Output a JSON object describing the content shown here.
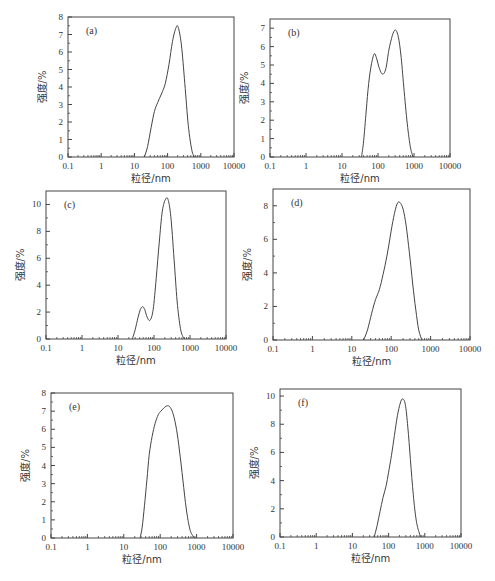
{
  "figure": {
    "xlabel": "粒径/nm",
    "ylabel": "强度/%",
    "x_ticks": [
      "0.1",
      "1",
      "10",
      "100",
      "1000",
      "10000"
    ]
  },
  "chart_data": [
    {
      "type": "line",
      "panel_label": "(a)",
      "xscale": "log",
      "xlim": [
        0.1,
        10000
      ],
      "ylim": [
        0,
        8
      ],
      "xlabel": "粒径/nm",
      "ylabel": "强度/%",
      "x_ticks": [
        0.1,
        1,
        10,
        100,
        1000,
        10000
      ],
      "y_ticks": [
        0,
        1,
        2,
        3,
        4,
        5,
        6,
        7,
        8
      ],
      "series": [
        {
          "name": "a",
          "x": [
            20,
            25,
            32,
            40,
            50,
            65,
            85,
            110,
            140,
            180,
            210,
            260,
            330,
            420,
            550,
            700
          ],
          "y": [
            0,
            0.6,
            1.7,
            2.6,
            3.1,
            3.6,
            4.2,
            5.3,
            6.6,
            7.4,
            7.4,
            6.4,
            4.2,
            1.8,
            0.3,
            0
          ]
        }
      ],
      "frame": {
        "x": 68,
        "y": 17,
        "w": 166,
        "h": 140
      }
    },
    {
      "type": "line",
      "panel_label": "(b)",
      "xscale": "log",
      "xlim": [
        0.1,
        10000
      ],
      "ylim": [
        0,
        7.5
      ],
      "xlabel": "粒径/nm",
      "ylabel": "强度/%",
      "x_ticks": [
        0.1,
        1,
        10,
        100,
        1000,
        10000
      ],
      "y_ticks": [
        0,
        1,
        2,
        3,
        4,
        5,
        6,
        7
      ],
      "series": [
        {
          "name": "b",
          "x": [
            35,
            40,
            47,
            55,
            65,
            78,
            90,
            110,
            135,
            165,
            200,
            250,
            300,
            360,
            430,
            520,
            650,
            800,
            950
          ],
          "y": [
            0,
            0.9,
            2.5,
            4.0,
            5.0,
            5.6,
            5.4,
            4.8,
            4.5,
            4.8,
            5.8,
            6.6,
            6.9,
            6.6,
            5.6,
            3.8,
            1.8,
            0.5,
            0
          ]
        }
      ],
      "frame": {
        "x": 270,
        "y": 19,
        "w": 180,
        "h": 138
      }
    },
    {
      "type": "line",
      "panel_label": "(c)",
      "xscale": "log",
      "xlim": [
        0.1,
        10000
      ],
      "ylim": [
        0,
        11
      ],
      "xlabel": "粒径/nm",
      "ylabel": "强度/%",
      "x_ticks": [
        0.1,
        1,
        10,
        100,
        1000,
        10000
      ],
      "y_ticks": [
        0,
        2,
        4,
        6,
        8,
        10
      ],
      "series": [
        {
          "name": "c",
          "x": [
            25,
            30,
            36,
            42,
            48,
            55,
            65,
            78,
            95,
            115,
            140,
            170,
            210,
            250,
            300,
            370,
            450,
            560,
            700
          ],
          "y": [
            0,
            0.7,
            1.6,
            2.2,
            2.4,
            2.2,
            1.6,
            1.4,
            2.2,
            4.5,
            7.2,
            9.5,
            10.4,
            10.3,
            8.8,
            5.5,
            2.5,
            0.6,
            0
          ]
        }
      ],
      "frame": {
        "x": 46,
        "y": 191,
        "w": 180,
        "h": 148
      }
    },
    {
      "type": "line",
      "panel_label": "(d)",
      "xscale": "log",
      "xlim": [
        0.1,
        10000
      ],
      "ylim": [
        0,
        9
      ],
      "xlabel": "粒径/nm",
      "ylabel": "强度/%",
      "x_ticks": [
        0.1,
        1,
        10,
        100,
        1000,
        10000
      ],
      "y_ticks": [
        0,
        2,
        4,
        6,
        8
      ],
      "series": [
        {
          "name": "d",
          "x": [
            20,
            25,
            32,
            40,
            50,
            62,
            78,
            95,
            115,
            140,
            165,
            200,
            240,
            290,
            350,
            420,
            500,
            600
          ],
          "y": [
            0,
            0.6,
            1.6,
            2.4,
            3.0,
            3.9,
            5.0,
            6.2,
            7.3,
            8.1,
            8.2,
            7.8,
            6.8,
            5.2,
            3.4,
            1.8,
            0.6,
            0
          ]
        }
      ],
      "frame": {
        "x": 273,
        "y": 189,
        "w": 197,
        "h": 151
      }
    },
    {
      "type": "line",
      "panel_label": "(e)",
      "xscale": "log",
      "xlim": [
        0.1,
        10000
      ],
      "ylim": [
        0,
        8
      ],
      "xlabel": "粒径/nm",
      "ylabel": "强度/%",
      "x_ticks": [
        0.1,
        1,
        10,
        100,
        1000,
        10000
      ],
      "y_ticks": [
        0,
        1,
        2,
        3,
        4,
        5,
        6,
        7,
        8
      ],
      "series": [
        {
          "name": "e",
          "x": [
            28,
            32,
            37,
            43,
            50,
            60,
            72,
            88,
            105,
            130,
            160,
            190,
            230,
            280,
            340,
            420,
            520,
            650,
            800,
            920
          ],
          "y": [
            0,
            0.6,
            1.8,
            3.2,
            4.6,
            5.6,
            6.3,
            6.8,
            7.0,
            7.2,
            7.3,
            7.2,
            6.8,
            6.0,
            4.8,
            3.2,
            1.6,
            0.5,
            0.1,
            0
          ]
        }
      ],
      "frame": {
        "x": 51,
        "y": 393,
        "w": 182,
        "h": 145
      }
    },
    {
      "type": "line",
      "panel_label": "(f)",
      "xscale": "log",
      "xlim": [
        0.1,
        10000
      ],
      "ylim": [
        0,
        10.5
      ],
      "xlabel": "粒径/nm",
      "ylabel": "强度/%",
      "x_ticks": [
        0.1,
        1,
        10,
        100,
        1000,
        10000
      ],
      "y_ticks": [
        0,
        2,
        4,
        6,
        8,
        10
      ],
      "series": [
        {
          "name": "f",
          "x": [
            40,
            48,
            58,
            70,
            85,
            100,
            120,
            145,
            175,
            210,
            245,
            290,
            340,
            400,
            480,
            580,
            700,
            800
          ],
          "y": [
            0,
            0.8,
            1.8,
            2.8,
            3.6,
            4.6,
            5.8,
            7.2,
            8.6,
            9.5,
            9.8,
            9.4,
            7.8,
            5.5,
            3.0,
            1.2,
            0.3,
            0
          ]
        }
      ],
      "frame": {
        "x": 280,
        "y": 389,
        "w": 181,
        "h": 148
      }
    }
  ]
}
